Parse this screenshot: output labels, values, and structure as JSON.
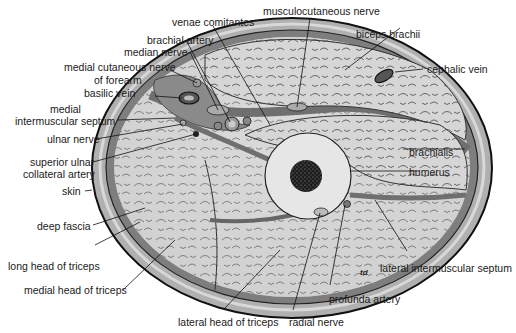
{
  "diagram": {
    "signature": "td",
    "labels": {
      "venae_comitantes": "venae comitantes",
      "musculocutaneous_nerve": "musculocutaneous nerve",
      "brachial_artery": "brachial artery",
      "biceps_brachii": "biceps brachii",
      "median_nerve": "median nerve",
      "medial_cutaneous_nerve_1": "medial cutaneous nerve",
      "medial_cutaneous_nerve_2": "of forearm",
      "cephalic_vein": "cephalic vein",
      "basilic_vein": "basilic vein",
      "medial_intermuscular_septum_1": "medial",
      "medial_intermuscular_septum_2": "intermuscular septum",
      "ulnar_nerve": "ulnar nerve",
      "superior_ulnar_1": "superior ulnar",
      "superior_ulnar_2": "collateral artery",
      "brachialis": "brachialis",
      "humerus": "humerus",
      "skin": "skin",
      "deep_fascia": "deep fascia",
      "long_head_triceps": "long head of triceps",
      "medial_head_triceps": "medial head of triceps",
      "lateral_intermuscular_septum": "lateral intermuscular septum",
      "profunda_artery": "profunda artery",
      "lateral_head_triceps": "lateral head of triceps",
      "radial_nerve": "radial nerve"
    },
    "colors": {
      "skin": "#a9a9a9",
      "subcutaneous": "#8a8a8a",
      "muscle": "#d4d4d4",
      "bone_cortex": "#e4e4e4",
      "marrow": "#2a2a2a",
      "outline": "#111111"
    }
  }
}
